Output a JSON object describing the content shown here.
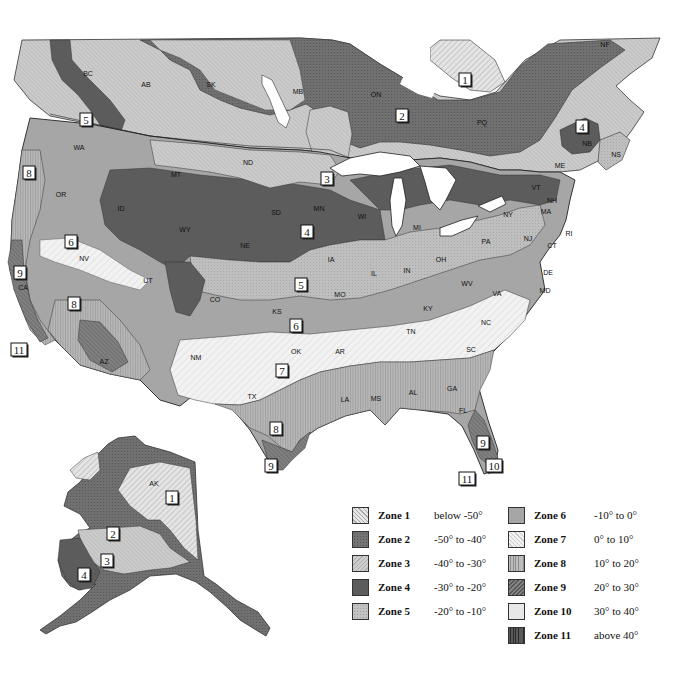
{
  "map": {
    "type": "plant hardiness zone map",
    "region": "North America (Canada, contiguous US, Alaska)",
    "zone_colors": {
      "1": "#e2e2e2",
      "2": "#6f6f6f",
      "3": "#c8c8c8",
      "4": "#5a5a5a",
      "5": "#bdbdbd",
      "6": "#a4a4a4",
      "7": "#eeeeee",
      "8": "#b2b2b2",
      "9": "#7d7d7d",
      "10": "#e6e6e6",
      "11": "#4a4a4a"
    },
    "state_labels": [
      {
        "id": "BC",
        "x": 88,
        "y": 76
      },
      {
        "id": "AB",
        "x": 146,
        "y": 87
      },
      {
        "id": "SK",
        "x": 211,
        "y": 87
      },
      {
        "id": "MB",
        "x": 298,
        "y": 94
      },
      {
        "id": "ON",
        "x": 376,
        "y": 97
      },
      {
        "id": "PQ",
        "x": 482,
        "y": 125
      },
      {
        "id": "NF",
        "x": 605,
        "y": 47
      },
      {
        "id": "NB",
        "x": 587,
        "y": 146
      },
      {
        "id": "NS",
        "x": 616,
        "y": 157
      },
      {
        "id": "WA",
        "x": 79,
        "y": 150
      },
      {
        "id": "OR",
        "x": 61,
        "y": 197
      },
      {
        "id": "ID",
        "x": 121,
        "y": 211
      },
      {
        "id": "MT",
        "x": 176,
        "y": 177
      },
      {
        "id": "WY",
        "x": 185,
        "y": 232
      },
      {
        "id": "ND",
        "x": 248,
        "y": 165
      },
      {
        "id": "SD",
        "x": 276,
        "y": 215
      },
      {
        "id": "MN",
        "x": 319,
        "y": 211
      },
      {
        "id": "WI",
        "x": 362,
        "y": 219
      },
      {
        "id": "MI",
        "x": 417,
        "y": 230
      },
      {
        "id": "NY",
        "x": 508,
        "y": 217
      },
      {
        "id": "VT",
        "x": 536,
        "y": 190
      },
      {
        "id": "NH",
        "x": 552,
        "y": 203
      },
      {
        "id": "ME",
        "x": 560,
        "y": 168
      },
      {
        "id": "MA",
        "x": 546,
        "y": 214
      },
      {
        "id": "RI",
        "x": 569,
        "y": 236
      },
      {
        "id": "CT",
        "x": 552,
        "y": 248
      },
      {
        "id": "NJ",
        "x": 528,
        "y": 241
      },
      {
        "id": "PA",
        "x": 486,
        "y": 244
      },
      {
        "id": "DE",
        "x": 548,
        "y": 275
      },
      {
        "id": "MD",
        "x": 545,
        "y": 293
      },
      {
        "id": "NV",
        "x": 84,
        "y": 261
      },
      {
        "id": "UT",
        "x": 148,
        "y": 283
      },
      {
        "id": "CO",
        "x": 215,
        "y": 302
      },
      {
        "id": "NE",
        "x": 245,
        "y": 248
      },
      {
        "id": "IA",
        "x": 331,
        "y": 262
      },
      {
        "id": "IL",
        "x": 374,
        "y": 276
      },
      {
        "id": "IN",
        "x": 407,
        "y": 273
      },
      {
        "id": "OH",
        "x": 441,
        "y": 262
      },
      {
        "id": "WV",
        "x": 467,
        "y": 286
      },
      {
        "id": "VA",
        "x": 497,
        "y": 296
      },
      {
        "id": "KY",
        "x": 428,
        "y": 311
      },
      {
        "id": "MO",
        "x": 340,
        "y": 297
      },
      {
        "id": "KS",
        "x": 277,
        "y": 314
      },
      {
        "id": "CA",
        "x": 23,
        "y": 290
      },
      {
        "id": "AZ",
        "x": 104,
        "y": 364
      },
      {
        "id": "NM",
        "x": 196,
        "y": 360
      },
      {
        "id": "OK",
        "x": 296,
        "y": 354
      },
      {
        "id": "AR",
        "x": 340,
        "y": 354
      },
      {
        "id": "TN",
        "x": 411,
        "y": 334
      },
      {
        "id": "NC",
        "x": 486,
        "y": 325
      },
      {
        "id": "SC",
        "x": 471,
        "y": 352
      },
      {
        "id": "TX",
        "x": 252,
        "y": 399
      },
      {
        "id": "LA",
        "x": 345,
        "y": 402
      },
      {
        "id": "MS",
        "x": 376,
        "y": 401
      },
      {
        "id": "AL",
        "x": 413,
        "y": 395
      },
      {
        "id": "GA",
        "x": 452,
        "y": 391
      },
      {
        "id": "FL",
        "x": 463,
        "y": 413
      },
      {
        "id": "AK",
        "x": 154,
        "y": 486
      }
    ],
    "zone_labels": [
      {
        "zone": "1",
        "x": 465,
        "y": 80
      },
      {
        "zone": "2",
        "x": 402,
        "y": 116
      },
      {
        "zone": "3",
        "x": 327,
        "y": 179
      },
      {
        "zone": "4",
        "x": 582,
        "y": 127
      },
      {
        "zone": "5",
        "x": 86,
        "y": 120
      },
      {
        "zone": "8",
        "x": 29,
        "y": 173
      },
      {
        "zone": "4",
        "x": 307,
        "y": 232
      },
      {
        "zone": "6",
        "x": 71,
        "y": 242
      },
      {
        "zone": "9",
        "x": 20,
        "y": 273
      },
      {
        "zone": "5",
        "x": 301,
        "y": 285
      },
      {
        "zone": "8",
        "x": 74,
        "y": 304
      },
      {
        "zone": "6",
        "x": 296,
        "y": 326
      },
      {
        "zone": "11",
        "x": 19,
        "y": 350
      },
      {
        "zone": "7",
        "x": 282,
        "y": 371
      },
      {
        "zone": "8",
        "x": 276,
        "y": 429
      },
      {
        "zone": "9",
        "x": 271,
        "y": 466
      },
      {
        "zone": "9",
        "x": 483,
        "y": 443
      },
      {
        "zone": "10",
        "x": 494,
        "y": 466
      },
      {
        "zone": "11",
        "x": 467,
        "y": 479
      },
      {
        "zone": "1",
        "x": 172,
        "y": 498
      },
      {
        "zone": "2",
        "x": 113,
        "y": 534
      },
      {
        "zone": "3",
        "x": 107,
        "y": 561
      },
      {
        "zone": "4",
        "x": 84,
        "y": 575
      }
    ]
  },
  "legend": {
    "title": "",
    "items": [
      {
        "zone": "1",
        "name": "Zone 1",
        "range": "below -50°",
        "color": "#e2e2e2",
        "pattern": "diag-light"
      },
      {
        "zone": "2",
        "name": "Zone 2",
        "range": "-50° to -40°",
        "color": "#6f6f6f",
        "pattern": "cross-dark"
      },
      {
        "zone": "3",
        "name": "Zone 3",
        "range": "-40° to -30°",
        "color": "#c8c8c8",
        "pattern": "diag-fine"
      },
      {
        "zone": "4",
        "name": "Zone 4",
        "range": "-30° to -20°",
        "color": "#5a5a5a",
        "pattern": "solid-dark"
      },
      {
        "zone": "5",
        "name": "Zone 5",
        "range": "-20° to -10°",
        "color": "#bdbdbd",
        "pattern": "cross-light"
      },
      {
        "zone": "6",
        "name": "Zone 6",
        "range": "-10° to 0°",
        "color": "#a4a4a4",
        "pattern": "solid-mid"
      },
      {
        "zone": "7",
        "name": "Zone 7",
        "range": "0° to 10°",
        "color": "#eeeeee",
        "pattern": "diag-white"
      },
      {
        "zone": "8",
        "name": "Zone 8",
        "range": "10° to 20°",
        "color": "#b2b2b2",
        "pattern": "vertical"
      },
      {
        "zone": "9",
        "name": "Zone 9",
        "range": "20° to 30°",
        "color": "#7d7d7d",
        "pattern": "diag-dark"
      },
      {
        "zone": "10",
        "name": "Zone 10",
        "range": "30° to 40°",
        "color": "#e6e6e6",
        "pattern": "solid-light"
      },
      {
        "zone": "11",
        "name": "Zone 11",
        "range": "above 40°",
        "color": "#4a4a4a",
        "pattern": "vertical-dark"
      }
    ]
  }
}
